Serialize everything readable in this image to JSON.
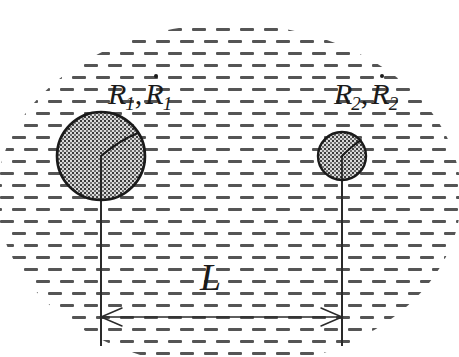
{
  "figure": {
    "kind": "scientific-schematic",
    "background_color": "#ffffff",
    "ink_color": "#1a1a1a",
    "liquid": {
      "name": "liquid-medium",
      "representation": "short horizontal dashes filling an elliptical region",
      "dash_color": "#4a4a4a",
      "dash_width_px": 14,
      "dash_height_px": 3,
      "ellipse_center": [
        229,
        196
      ],
      "ellipse_rx": 232,
      "ellipse_ry": 172
    },
    "bubbles": [
      {
        "name": "bubble-1",
        "label": "R1",
        "center_x": 101,
        "center_y": 156,
        "radius": 44,
        "fill": "#8c8c8c",
        "stroke": "#1a1a1a"
      },
      {
        "name": "bubble-2",
        "label": "R2",
        "center_x": 342,
        "center_y": 156,
        "radius": 24,
        "fill": "#8c8c8c",
        "stroke": "#1a1a1a"
      }
    ],
    "dimension": {
      "name": "separation-distance",
      "symbol": "L",
      "arrow_y": 317,
      "from_x": 101,
      "to_x": 342,
      "extension_line_top": 156,
      "extension_line_bottom": 346
    }
  },
  "labels": {
    "bubble1": {
      "name": "label-radius-1",
      "radius_symbol": "R",
      "radius_subscript": "1",
      "separator": ",",
      "rate_symbol": "R",
      "rate_subscript": "1",
      "rate_has_dot": true,
      "full_text": "R₁, Ṙ₁"
    },
    "bubble2": {
      "name": "label-radius-2",
      "radius_symbol": "R",
      "radius_subscript": "2",
      "separator": ",",
      "rate_symbol": "R",
      "rate_subscript": "2",
      "rate_has_dot": true,
      "full_text": "R₂, Ṙ₂"
    },
    "distance": {
      "name": "label-distance",
      "symbol": "L",
      "full_text": "L"
    }
  }
}
